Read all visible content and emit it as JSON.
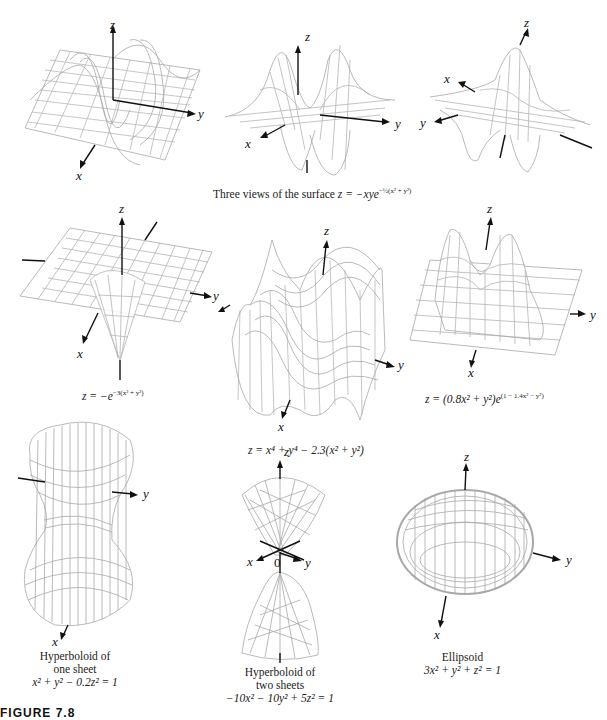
{
  "figure": {
    "label": "FIGURE 7.8",
    "row1_caption": "Three views of the surface z = −xye^{−½(x²+y²)}",
    "row1_caption_parts": {
      "prefix": "Three views of the surface ",
      "eq": "z = −xye",
      "exp": "−½(x² + y²)"
    }
  },
  "panels": [
    {
      "id": "saddle-view-1",
      "axes": {
        "x": "x",
        "y": "y",
        "z": "z"
      }
    },
    {
      "id": "saddle-view-2",
      "axes": {
        "x": "x",
        "y": "y",
        "z": "z"
      }
    },
    {
      "id": "saddle-view-3",
      "axes": {
        "x": "x",
        "y": "y",
        "z": "z"
      }
    },
    {
      "id": "well",
      "axes": {
        "x": "x",
        "y": "y",
        "z": "z"
      },
      "caption_eq": "z = −e",
      "caption_exp": "−3(x² + y²)"
    },
    {
      "id": "quartic",
      "axes": {
        "x": "x",
        "y": "y",
        "z": "z"
      },
      "caption": "z = x⁴ + y⁴ − 2.3(x² + y²)"
    },
    {
      "id": "twin-peaks",
      "axes": {
        "x": "x",
        "y": "y",
        "z": "z"
      },
      "caption_eq": "z = (0.8x² + y²)e",
      "caption_exp": "(1 − 1.4x² − y²)"
    },
    {
      "id": "hyperboloid-one-sheet",
      "axes": {
        "x": "x",
        "y": "y",
        "z": "z"
      },
      "caption_lines": [
        "Hyperboloid of",
        "one sheet",
        "x² + y² − 0.2z² = 1"
      ]
    },
    {
      "id": "hyperboloid-two-sheets",
      "axes": {
        "x": "x",
        "y": "y",
        "z": "z",
        "origin": "0"
      },
      "caption_lines": [
        "Hyperboloid of",
        "two sheets",
        "−10x² − 10y² + 5z² = 1"
      ]
    },
    {
      "id": "ellipsoid",
      "axes": {
        "x": "x",
        "y": "y",
        "z": "z"
      },
      "caption_lines": [
        "Ellipsoid",
        "3x² + y² + z² = 1"
      ]
    }
  ],
  "colors": {
    "mesh": "#a8a8a8",
    "axis": "#111111",
    "background": "#ffffff"
  }
}
